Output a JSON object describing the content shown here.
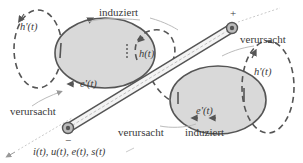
{
  "diagram": {
    "type": "electromagnetic-induction-schematic",
    "colors": {
      "background": "#ffffff",
      "ellipse_fill": "#d9d9d9",
      "stroke": "#555555",
      "text": "#3a3a3a",
      "light_arrow": "#bbbbbb"
    },
    "terminals": {
      "plus": "+",
      "minus": "−"
    },
    "fields": {
      "left_e": "e'(t)",
      "right_e": "e'(t)",
      "left_h_prime": "h'(t)",
      "h_main": "h(t)",
      "right_h_prime": "h'(t)"
    },
    "relations": {
      "top_induziert": "induziert",
      "top_right_verursacht": "verursacht",
      "left_verursacht": "verursacht",
      "bottom_verursacht": "verursacht",
      "bottom_induziert": "induziert"
    },
    "conductor_quantities": "i(t), u(t), e(t), s(t)"
  }
}
